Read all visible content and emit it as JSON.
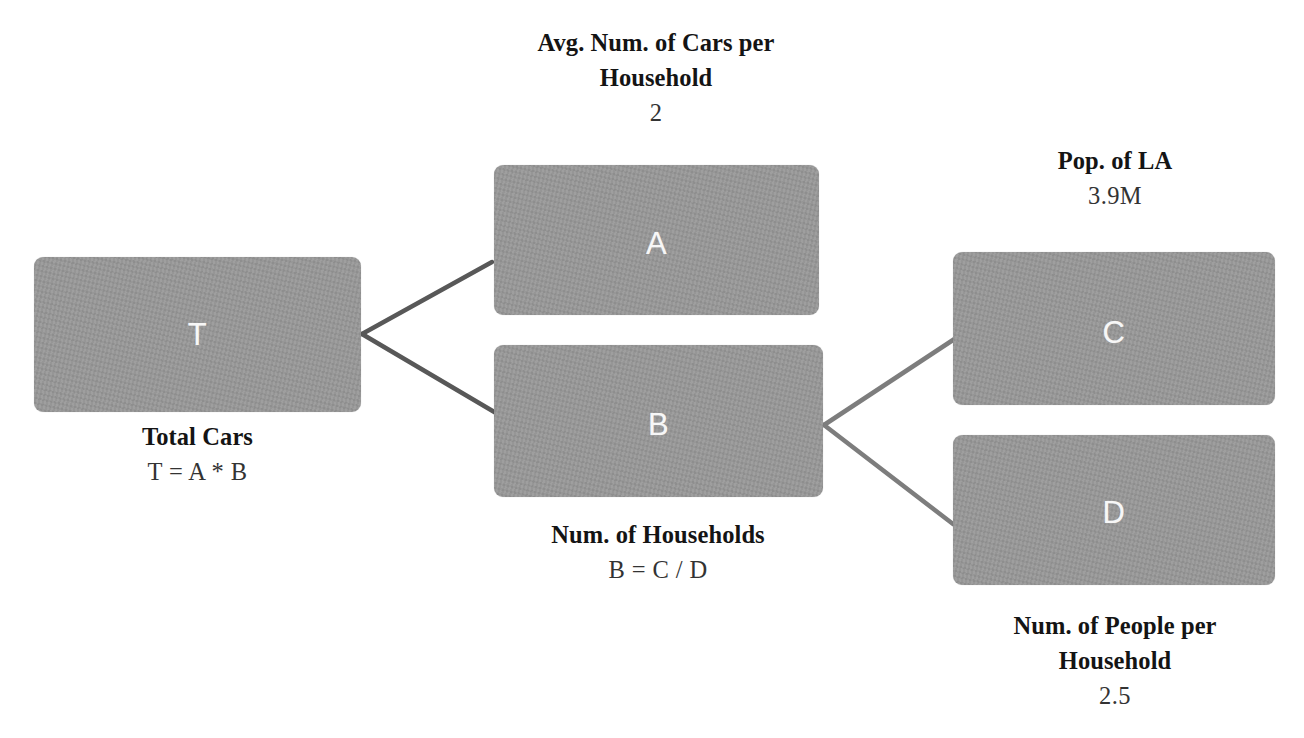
{
  "diagram": {
    "background_color": "#ffffff",
    "node_fill_color": "#989898",
    "node_label_color": "#f7f7f7",
    "edge_color_left": "#585858",
    "edge_color_right": "#7d7d7d",
    "text_color": "#141414"
  },
  "nodes": [
    {
      "id": "T",
      "letter": "T",
      "caption_title": "Total Cars",
      "caption_value": "T = A * B",
      "caption_position": "below"
    },
    {
      "id": "A",
      "letter": "A",
      "caption_title": "Avg. Num. of Cars per Household",
      "caption_value": "2",
      "caption_position": "above"
    },
    {
      "id": "B",
      "letter": "B",
      "caption_title": "Num. of Households",
      "caption_value": "B = C / D",
      "caption_position": "below"
    },
    {
      "id": "C",
      "letter": "C",
      "caption_title": "Pop. of LA",
      "caption_value": "3.9M",
      "caption_position": "above"
    },
    {
      "id": "D",
      "letter": "D",
      "caption_title": "Num. of People per Household",
      "caption_value": "2.5",
      "caption_position": "below"
    }
  ],
  "captions": {
    "a_title_line1": "Avg. Num. of Cars per",
    "a_title_line2": "Household",
    "a_value": "2",
    "c_title": "Pop. of LA",
    "c_value": "3.9M",
    "t_title": "Total Cars",
    "t_value": "T = A * B",
    "b_title": "Num. of Households",
    "b_value": "B = C / D",
    "d_title_line1": "Num. of People per",
    "d_title_line2": "Household",
    "d_value": "2.5"
  },
  "edges": [
    {
      "from": "T",
      "to": "A"
    },
    {
      "from": "T",
      "to": "B"
    },
    {
      "from": "B",
      "to": "C"
    },
    {
      "from": "B",
      "to": "D"
    }
  ]
}
